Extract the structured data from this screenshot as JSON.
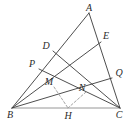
{
  "figure": {
    "type": "euclidean-geometry-diagram",
    "width": 134,
    "height": 124,
    "background_color": "#ffffff",
    "stroke_color": "#3a3a3a",
    "dashed_stroke_color": "#9a9a9a",
    "baseline_color": "#8a8a8a"
  },
  "points": [
    {
      "id": "A",
      "label": "A",
      "x": 89,
      "y": 13,
      "label_x": 89,
      "label_y": 8
    },
    {
      "id": "E",
      "label": "E",
      "x": 101,
      "y": 42,
      "label_x": 106,
      "label_y": 36
    },
    {
      "id": "D",
      "label": "D",
      "x": 53,
      "y": 51,
      "label_x": 46,
      "label_y": 46
    },
    {
      "id": "P",
      "label": "P",
      "x": 39,
      "y": 69,
      "label_x": 32,
      "label_y": 64
    },
    {
      "id": "Q",
      "label": "Q",
      "x": 112,
      "y": 78,
      "label_x": 119,
      "label_y": 73
    },
    {
      "id": "M",
      "label": "M",
      "x": 54,
      "y": 87,
      "label_x": 49,
      "label_y": 82
    },
    {
      "id": "N",
      "label": "N",
      "x": 86,
      "y": 92,
      "label_x": 82,
      "label_y": 88
    },
    {
      "id": "B",
      "label": "B",
      "x": 12,
      "y": 108,
      "label_x": 10,
      "label_y": 115
    },
    {
      "id": "H",
      "label": "H",
      "x": 68,
      "y": 108,
      "label_x": 68,
      "label_y": 116
    },
    {
      "id": "C",
      "label": "C",
      "x": 120,
      "y": 108,
      "label_x": 119,
      "label_y": 115
    }
  ],
  "segments": [
    {
      "id": "AB",
      "from": "A",
      "to": "B",
      "style": "solid"
    },
    {
      "id": "AC",
      "from": "A",
      "to": "C",
      "style": "solid"
    },
    {
      "id": "BC",
      "from": "B",
      "to": "C",
      "style": "solid"
    },
    {
      "id": "BE",
      "from": "B",
      "to": "E",
      "style": "solid"
    },
    {
      "id": "CD",
      "from": "C",
      "to": "D",
      "style": "solid"
    },
    {
      "id": "BQ",
      "from": "B",
      "to": "Q",
      "style": "solid"
    },
    {
      "id": "PC",
      "from": "P",
      "to": "C",
      "style": "solid"
    },
    {
      "id": "MH",
      "from": "M",
      "to": "H",
      "style": "dashed"
    },
    {
      "id": "NH",
      "from": "N",
      "to": "H",
      "style": "dashed"
    }
  ],
  "labels_order": [
    "A",
    "E",
    "D",
    "P",
    "Q",
    "M",
    "N",
    "B",
    "H",
    "C"
  ]
}
